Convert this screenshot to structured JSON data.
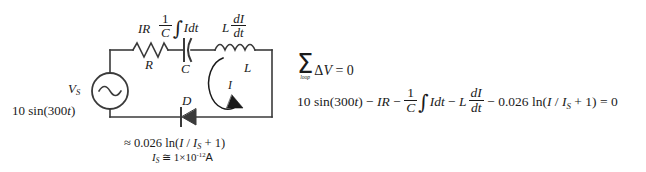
{
  "figure": {
    "background_color": "#ffffff",
    "line_color": "#3a3a3a",
    "text_color": "#1a1a1a"
  },
  "circuit": {
    "source": {
      "symbol_name": "ac-voltage-source",
      "label": "V",
      "label_sub": "S",
      "expression": "10 sin(300",
      "expression_var": "t",
      "expression_tail": ")"
    },
    "resistor": {
      "symbol_name": "resistor",
      "designator": "R",
      "voltage_label": "IR"
    },
    "capacitor": {
      "symbol_name": "capacitor",
      "designator": "C",
      "voltage_label_num": "1",
      "voltage_label_den": "C",
      "voltage_label_integrand": "Idt"
    },
    "inductor": {
      "symbol_name": "inductor",
      "designator": "L",
      "voltage_label_lead": "L",
      "voltage_label_num": "dI",
      "voltage_label_den": "dt"
    },
    "diode": {
      "symbol_name": "diode",
      "designator": "D",
      "drop_expression": "≈ 0.026 ln(",
      "drop_var_i": "I",
      "drop_slash": " / ",
      "drop_var_is": "I",
      "drop_var_is_sub": "S",
      "drop_tail": " + 1)",
      "saturation_lead": "I",
      "saturation_sub": "S",
      "saturation_rel": " ≅ 1×10",
      "saturation_exp": "-12",
      "saturation_unit": "A"
    },
    "current_loop": {
      "symbol_name": "loop-current-arrow",
      "label": "I"
    }
  },
  "equations": {
    "kvl": {
      "sum_symbol": "Σ",
      "sum_limit": "loop",
      "body_delta": "Δ",
      "body_v": "V",
      "body_eq": " = 0"
    },
    "expanded": {
      "term_source": "10 sin(300",
      "term_source_var": "t",
      "term_source_tail": ")",
      "op1": " − ",
      "term_resistor": "IR",
      "op2": " − ",
      "term_cap_num": "1",
      "term_cap_den": "C",
      "term_cap_integrand": "Idt",
      "op3": " − ",
      "term_ind_lead": "L",
      "term_ind_num": "dI",
      "term_ind_den": "dt",
      "op4": " − ",
      "term_diode": "0.026 ln(",
      "term_diode_i": "I",
      "term_diode_slash": " / ",
      "term_diode_is": "I",
      "term_diode_is_sub": "S",
      "term_diode_tail": " + 1)",
      "result": " = 0"
    }
  }
}
